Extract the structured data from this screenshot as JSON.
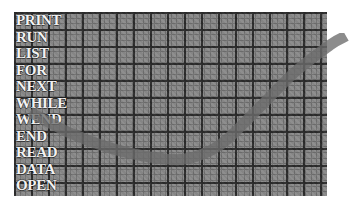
{
  "image": {
    "title": "BASIC keyword list over graph paper with plotted curve",
    "background_color": "#ffffff"
  },
  "grid": {
    "label": "graph-paper-grid",
    "paper_color": "#8a8a8a",
    "major_line_color": "#2b2b2b",
    "minor_line_color": "#6f6f6f",
    "major_spacing_px": 17,
    "minor_spacing_px": 5.6,
    "left": 14,
    "top": 12,
    "width": 313,
    "height": 184
  },
  "keywords": {
    "label": "basic-keyword-list",
    "text_color": "#f2f2f2",
    "items": [
      {
        "label": "PRINT"
      },
      {
        "label": "RUN"
      },
      {
        "label": "LIST"
      },
      {
        "label": "FOR"
      },
      {
        "label": "NEXT"
      },
      {
        "label": "WHILE"
      },
      {
        "label": "WEND"
      },
      {
        "label": "END"
      },
      {
        "label": "READ"
      },
      {
        "label": "DATA"
      },
      {
        "label": "OPEN"
      }
    ]
  },
  "curve": {
    "label": "plotted-curve-band",
    "color": "#6b6b6b",
    "opacity": 0.78,
    "stroke_width_px": 11,
    "shape": "u-shaped rising to upper right",
    "points": [
      {
        "x": 30,
        "y": 112
      },
      {
        "x": 70,
        "y": 133
      },
      {
        "x": 110,
        "y": 148
      },
      {
        "x": 150,
        "y": 157
      },
      {
        "x": 185,
        "y": 159
      },
      {
        "x": 220,
        "y": 145
      },
      {
        "x": 255,
        "y": 112
      },
      {
        "x": 295,
        "y": 72
      },
      {
        "x": 330,
        "y": 45
      },
      {
        "x": 346,
        "y": 36
      }
    ]
  },
  "chart_data": {
    "type": "line",
    "title": "",
    "xlabel": "",
    "ylabel": "",
    "grid": true,
    "legend": "none",
    "x": [
      0,
      1,
      2,
      3,
      4,
      5,
      6,
      7,
      8,
      9
    ],
    "series": [
      {
        "name": "curve",
        "values": [
          112,
          133,
          148,
          157,
          159,
          145,
          112,
          72,
          45,
          36
        ]
      }
    ]
  }
}
